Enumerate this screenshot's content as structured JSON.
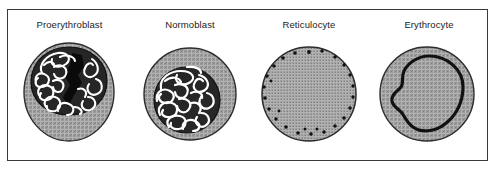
{
  "figure": {
    "frame_border_color": "#3a3a3a",
    "background_color": "#ffffff"
  },
  "palette": {
    "cytoplasm_gray": "#9a9a9a",
    "cytoplasm_stipple_light": "#b5b5b5",
    "cytoplasm_stipple_dark": "#7d7d7d",
    "outline_black": "#1b1b1b",
    "nucleus_dark": "#2b2b2b",
    "chromatin_white": "#ffffff",
    "label_text": "#1b1b1b"
  },
  "cells": [
    {
      "id": "proerythroblast",
      "label": "Proerythroblast",
      "nucleus": "large-offset-nucleus-with-white-chromatin-and-black-mass",
      "cytoplasm": "stippled-gray",
      "order": 1
    },
    {
      "id": "normoblast",
      "label": "Normoblast",
      "nucleus": "condensed-central-nucleus-with-dense-white-chromatin-mesh",
      "cytoplasm": "stippled-gray",
      "order": 2
    },
    {
      "id": "reticulocyte",
      "label": "Reticulocyte",
      "nucleus": "none",
      "cytoplasm": "stippled-gray-with-peripheral-black-granules",
      "order": 3
    },
    {
      "id": "erythrocyte",
      "label": "Erythrocyte",
      "nucleus": "none",
      "cytoplasm": "stippled-gray-with-biconcave-depression-outline",
      "order": 4
    }
  ]
}
